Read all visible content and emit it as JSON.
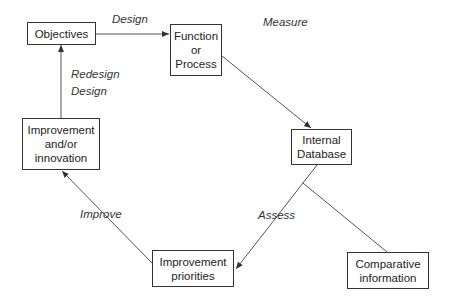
{
  "nodes": {
    "objectives": {
      "lines": [
        "Objectives"
      ]
    },
    "function": {
      "lines": [
        "Function",
        "or",
        "Process"
      ]
    },
    "database": {
      "lines": [
        "Internal",
        "Database"
      ]
    },
    "innovation": {
      "lines": [
        "Improvement",
        "and/or",
        "innovation"
      ]
    },
    "priorities": {
      "lines": [
        "Improvement",
        "priorities"
      ]
    },
    "comparative": {
      "lines": [
        "Comparative",
        "information"
      ]
    }
  },
  "edge_labels": {
    "design": "Design",
    "measure": "Measure",
    "redesign": "Redesign",
    "redesign_design": "Design",
    "improve": "Improve",
    "assess": "Assess"
  },
  "colors": {
    "line": "#555555",
    "border": "#333333"
  }
}
